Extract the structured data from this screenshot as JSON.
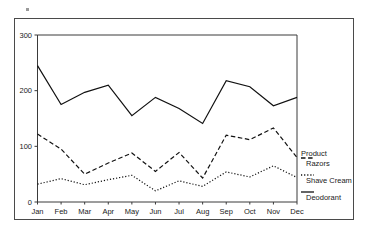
{
  "chart_data": {
    "type": "line",
    "title": "",
    "xlabel": "",
    "ylabel": "",
    "ylim": [
      0,
      300
    ],
    "yticks": [
      0,
      100,
      200,
      300
    ],
    "grid": false,
    "legend_position": "right",
    "legend_title": "Product",
    "categories": [
      "Jan",
      "Feb",
      "Mar",
      "Apr",
      "May",
      "Jun",
      "Jul",
      "Aug",
      "Sep",
      "Oct",
      "Nov",
      "Dec"
    ],
    "series": [
      {
        "name": "Deodorant",
        "style": "solid",
        "values": [
          245,
          175,
          197,
          210,
          155,
          188,
          168,
          141,
          218,
          207,
          173,
          188
        ]
      },
      {
        "name": "Razors",
        "style": "dashed",
        "values": [
          122,
          95,
          50,
          70,
          88,
          55,
          89,
          43,
          120,
          112,
          133,
          80
        ]
      },
      {
        "name": "Shave Cream",
        "style": "dotted",
        "values": [
          32,
          42,
          31,
          40,
          48,
          20,
          38,
          28,
          54,
          45,
          65,
          44
        ]
      }
    ]
  },
  "axis": {
    "ytick_labels": [
      "0",
      "100",
      "200",
      "300"
    ],
    "xtick_labels": [
      "Jan",
      "Feb",
      "Mar",
      "Apr",
      "May",
      "Jun",
      "Jul",
      "Aug",
      "Sep",
      "Oct",
      "Nov",
      "Dec"
    ]
  },
  "legend": {
    "title": "Product",
    "entries": [
      {
        "label": "Razors",
        "style": "dashed"
      },
      {
        "label": "Shave Cream",
        "style": "dotted"
      },
      {
        "label": "Deodorant",
        "style": "solid"
      }
    ]
  }
}
